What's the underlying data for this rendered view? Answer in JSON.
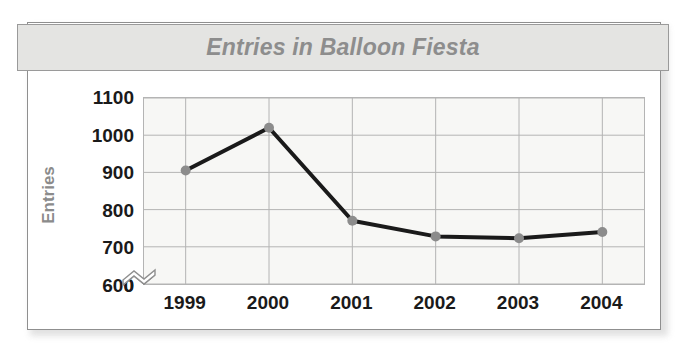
{
  "figure": {
    "title": "Entries in Balloon Fiesta",
    "title_color": "#8d8d8d",
    "frame_color": "#8f8f8f",
    "banner_fill": "#e4e4e2"
  },
  "chart_data": {
    "type": "line",
    "title": "Entries in Balloon Fiesta",
    "xlabel": "",
    "ylabel": "Entries",
    "categories": [
      "1999",
      "2000",
      "2001",
      "2002",
      "2003",
      "2004"
    ],
    "values": [
      905,
      1020,
      770,
      728,
      723,
      740
    ],
    "series": [
      {
        "name": "Entries",
        "values": [
          905,
          1020,
          770,
          728,
          723,
          740
        ]
      }
    ],
    "ylim": [
      600,
      1100
    ],
    "yticks": [
      "1100",
      "1000",
      "900",
      "800",
      "700",
      "600",
      "0"
    ],
    "ytick_values": [
      1100,
      1000,
      900,
      800,
      700,
      600,
      0
    ],
    "axis_break": true,
    "axis_break_between": [
      600,
      0
    ],
    "grid": true,
    "grid_color": "#b4b4b4",
    "legend": "none",
    "plot_background": "#f7f7f5",
    "line_color": "#1a1a1a",
    "marker_color": "#8c8c8c",
    "marker_shape": "circle"
  },
  "axes": {
    "y_title": "Entries",
    "y_title_color": "#8b8b8b",
    "tick_label_color": "#1a1a1a"
  }
}
